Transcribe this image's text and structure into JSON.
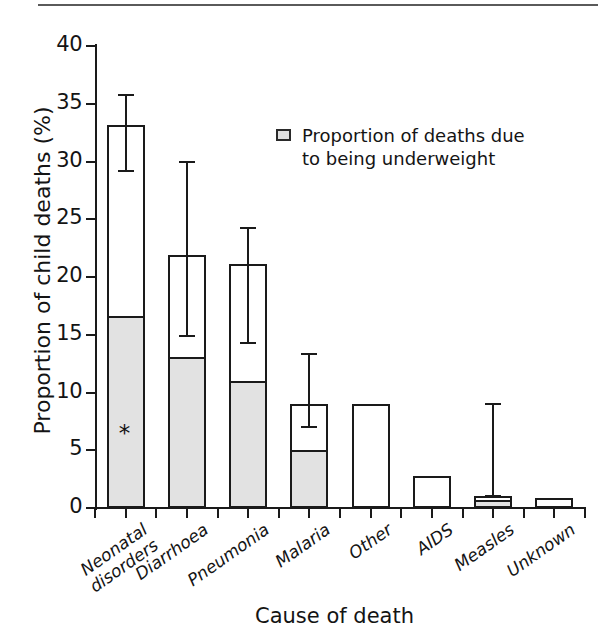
{
  "chart_data": {
    "type": "bar",
    "title": "",
    "xlabel": "Cause of death",
    "ylabel": "Proportion of child deaths (%)",
    "ylim": [
      0,
      40
    ],
    "ytick_labels": [
      "0",
      "5",
      "10",
      "15",
      "20",
      "25",
      "30",
      "35",
      "40"
    ],
    "ytick_values": [
      0,
      5,
      10,
      15,
      20,
      25,
      30,
      35,
      40
    ],
    "grid": false,
    "legend_position": "inside-top-right",
    "categories": [
      "Neonatal disorders",
      "Diarrhoea",
      "Pneumonia",
      "Malaria",
      "Other",
      "AIDS",
      "Measles",
      "Unknown"
    ],
    "series": [
      {
        "name": "Proportion of child deaths",
        "values": [
          33.2,
          21.9,
          21.1,
          9.0,
          9.0,
          2.8,
          1.0,
          0.9
        ]
      },
      {
        "name": "Proportion of deaths due to being underweight",
        "values": [
          16.6,
          13.1,
          11.0,
          5.0,
          0,
          0,
          0.7,
          0
        ]
      }
    ],
    "error_bars": [
      {
        "category": "Neonatal disorders",
        "low": 29.2,
        "high": 35.8
      },
      {
        "category": "Diarrhoea",
        "low": 14.9,
        "high": 30.0
      },
      {
        "category": "Pneumonia",
        "low": 14.3,
        "high": 24.2
      },
      {
        "category": "Malaria",
        "low": 7.0,
        "high": 13.3
      },
      {
        "category": "Measles",
        "low": 1.0,
        "high": 9.0
      }
    ],
    "annotations": [
      {
        "text": "*",
        "category": "Neonatal disorders",
        "value": 6.4
      }
    ]
  },
  "legend": {
    "swatch_name": "shaded-square-swatch",
    "label": "Proportion of deaths due\nto being underweight"
  },
  "axes": {
    "y_title": "Proportion of child deaths (%)",
    "x_title": "Cause of death"
  }
}
